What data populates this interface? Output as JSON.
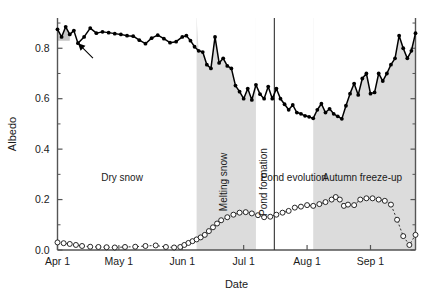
{
  "figure": {
    "title": "",
    "ylabel": "Albedo",
    "xlabel": "Date"
  },
  "chart_data": {
    "type": "line",
    "title": "",
    "xlabel": "Date",
    "ylabel": "Albedo",
    "ylim": [
      0.0,
      0.92
    ],
    "yticks": [
      0.0,
      0.2,
      0.4,
      0.6,
      0.8
    ],
    "ytick_labels": [
      "0.0",
      "0.2",
      "0.4",
      "0.6",
      "0.8"
    ],
    "y_minor_ticks": [
      0.1,
      0.3,
      0.5,
      0.7,
      0.9
    ],
    "xlim_days": [
      0,
      175
    ],
    "xticks_days": [
      0,
      30,
      61,
      91,
      122,
      153
    ],
    "xtick_labels": [
      "Apr 1",
      "May 1",
      "Jun 1",
      "Jul 1",
      "Aug 1",
      "Sep 1"
    ],
    "grid": false,
    "legend": "none",
    "series": [
      {
        "name": "Albedo",
        "marker": "filled-circle",
        "linestyle": "solid",
        "color": "#000000",
        "fill_under_in_shaded_regions": true,
        "x": [
          0,
          2,
          4,
          6,
          8,
          10,
          13,
          16,
          19,
          22,
          25,
          28,
          31,
          34,
          37,
          40,
          43,
          46,
          49,
          52,
          55,
          58,
          61,
          63,
          65,
          67,
          69,
          71,
          73,
          75,
          77,
          79,
          81,
          83,
          85,
          87,
          89,
          91,
          93,
          95,
          97,
          99,
          101,
          103,
          105,
          107,
          109,
          111,
          113,
          115,
          117,
          119,
          121,
          123,
          125,
          127,
          129,
          131,
          133,
          135,
          137,
          139,
          141,
          143,
          145,
          147,
          149,
          151,
          153,
          155,
          157,
          159,
          161,
          163,
          165,
          167,
          169,
          171,
          173,
          175
        ],
        "y": [
          0.875,
          0.845,
          0.885,
          0.855,
          0.87,
          0.82,
          0.845,
          0.88,
          0.86,
          0.865,
          0.862,
          0.858,
          0.855,
          0.85,
          0.848,
          0.832,
          0.818,
          0.84,
          0.852,
          0.838,
          0.822,
          0.826,
          0.845,
          0.85,
          0.83,
          0.806,
          0.79,
          0.785,
          0.735,
          0.72,
          0.845,
          0.742,
          0.76,
          0.73,
          0.72,
          0.652,
          0.628,
          0.6,
          0.64,
          0.595,
          0.655,
          0.618,
          0.6,
          0.648,
          0.6,
          0.64,
          0.6,
          0.578,
          0.556,
          0.575,
          0.545,
          0.54,
          0.532,
          0.528,
          0.522,
          0.556,
          0.58,
          0.545,
          0.56,
          0.54,
          0.53,
          0.52,
          0.572,
          0.62,
          0.66,
          0.615,
          0.68,
          0.7,
          0.62,
          0.625,
          0.7,
          0.67,
          0.7,
          0.735,
          0.76,
          0.85,
          0.8,
          0.76,
          0.79,
          0.86
        ]
      },
      {
        "name": "Pond fraction",
        "marker": "open-circle",
        "linestyle": "dotted",
        "color": "#000000",
        "x": [
          0,
          3,
          6,
          9,
          12,
          16,
          20,
          24,
          28,
          33,
          38,
          43,
          48,
          53,
          57,
          60,
          62,
          64,
          66,
          68,
          70,
          72,
          74,
          76,
          78,
          80,
          83,
          86,
          89,
          92,
          95,
          98,
          101,
          104,
          107,
          110,
          113,
          116,
          119,
          122,
          125,
          128,
          131,
          134,
          136,
          138,
          140,
          142,
          145,
          148,
          151,
          154,
          157,
          160,
          163,
          166,
          169,
          172,
          175
        ],
        "y": [
          0.03,
          0.027,
          0.024,
          0.02,
          0.016,
          0.013,
          0.012,
          0.011,
          0.01,
          0.012,
          0.013,
          0.016,
          0.018,
          0.012,
          0.01,
          0.012,
          0.02,
          0.028,
          0.035,
          0.042,
          0.05,
          0.06,
          0.075,
          0.09,
          0.105,
          0.118,
          0.13,
          0.14,
          0.148,
          0.15,
          0.145,
          0.138,
          0.13,
          0.132,
          0.14,
          0.148,
          0.155,
          0.168,
          0.172,
          0.178,
          0.175,
          0.182,
          0.19,
          0.2,
          0.21,
          0.2,
          0.175,
          0.18,
          0.178,
          0.2,
          0.205,
          0.205,
          0.2,
          0.195,
          0.18,
          0.12,
          0.055,
          0.02,
          0.06
        ]
      }
    ],
    "shaded_regions": [
      {
        "label": "",
        "x_start_day": 0,
        "x_end_day": 6,
        "color": "#cccccc",
        "note": "small gray box at start under albedo curve"
      },
      {
        "label": "Melting snow",
        "x_start_day": 68,
        "x_end_day": 97,
        "color": "#dadada"
      },
      {
        "label": "Autumn freeze-up",
        "x_start_day": 125,
        "x_end_day": 175,
        "color": "#dadada"
      }
    ],
    "vertical_lines": [
      {
        "label": "Pond formation",
        "x_day": 106
      }
    ],
    "phase_labels": [
      {
        "text": "Dry snow",
        "orientation": "horizontal"
      },
      {
        "text": "Melting snow",
        "orientation": "vertical"
      },
      {
        "text": "Pond formation",
        "orientation": "vertical"
      },
      {
        "text": "Pond evolution",
        "orientation": "horizontal"
      },
      {
        "text": "Autumn freeze-up",
        "orientation": "horizontal"
      }
    ],
    "annotations": [
      {
        "type": "arrow",
        "points_to_day": 10,
        "points_to_value": 0.82,
        "note": "arrow marking early-season albedo dip"
      }
    ]
  },
  "labels": {
    "dry_snow": "Dry snow",
    "melting_snow": "Melting snow",
    "pond_formation": "Pond formation",
    "pond_evolution": "Pond evolution",
    "autumn_freeze_up": "Autumn freeze-up"
  },
  "ticks": {
    "y": [
      "0.0",
      "0.2",
      "0.4",
      "0.6",
      "0.8"
    ],
    "x": [
      "Apr 1",
      "May 1",
      "Jun 1",
      "Jul 1",
      "Aug 1",
      "Sep 1"
    ]
  }
}
